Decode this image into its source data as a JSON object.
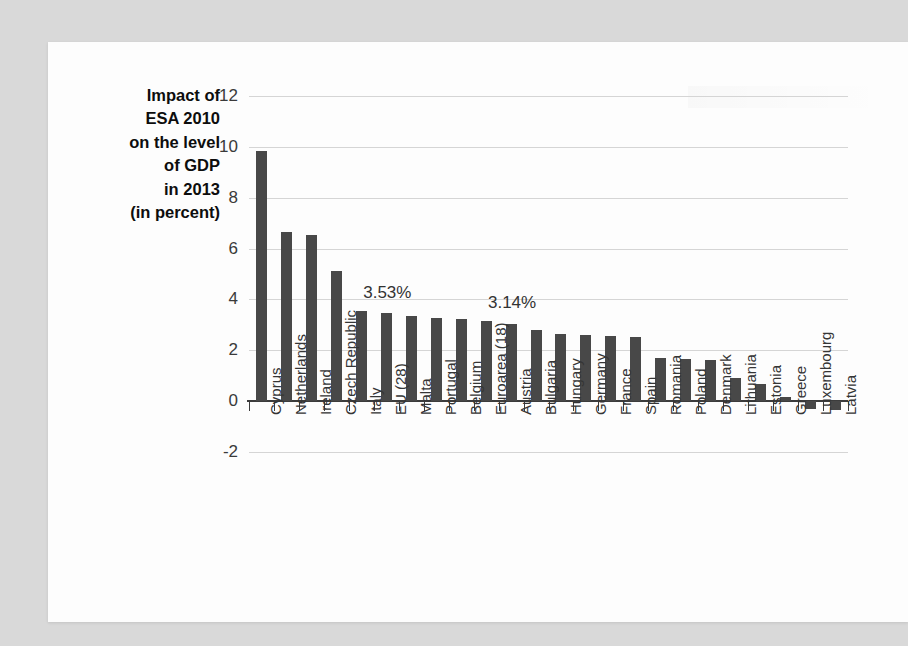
{
  "figure": {
    "background_color": "#d9d9d9",
    "card_color": "#fdfdfd",
    "bar_color": "#484848",
    "grid_color": "#d5d5d5",
    "axis_color": "#3c3c3c"
  },
  "axis_title_lines": [
    "Impact of",
    "ESA 2010",
    "on the level",
    "of GDP",
    "in 2013",
    "(in percent)"
  ],
  "chart_data": {
    "type": "bar",
    "xlabel": "",
    "ylabel": "",
    "ylim": [
      -2,
      12
    ],
    "yticks": [
      -2,
      0,
      2,
      4,
      6,
      8,
      10,
      12
    ],
    "ytick_labels": [
      "-2",
      "0",
      "2",
      "4",
      "6",
      "8",
      "10",
      "12"
    ],
    "grid": true,
    "legend": "none",
    "orientation": "vertical",
    "categories": [
      "Cyprus",
      "Netherlands",
      "Ireland",
      "Czech Republic",
      "Italy",
      "EU (28)",
      "Malta",
      "Portugal",
      "Belgium",
      "Euroarea (18)",
      "Austria",
      "Bulgaria",
      "Hungary",
      "Germany",
      "France",
      "Spain",
      "Romania",
      "Poland",
      "Denmark",
      "Lithuania",
      "Estonia",
      "Greece",
      "Luxembourg",
      "Latvia"
    ],
    "values": [
      9.84,
      6.66,
      6.54,
      5.13,
      3.53,
      3.46,
      3.34,
      3.28,
      3.25,
      3.14,
      3.03,
      2.78,
      2.64,
      2.6,
      2.58,
      2.52,
      1.7,
      1.65,
      1.6,
      0.92,
      0.68,
      0.15,
      -0.3,
      -0.33
    ],
    "annotations": [
      {
        "text": "3.53%",
        "category": "Italy",
        "value": 3.53
      },
      {
        "text": "3.14%",
        "category": "Euroarea (18)",
        "value": 3.14
      }
    ]
  }
}
